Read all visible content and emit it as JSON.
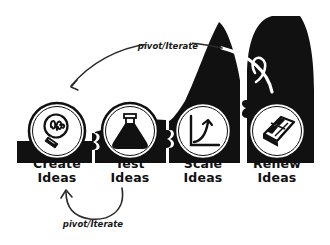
{
  "diagram": {
    "style": "hand-drawn sketch",
    "background_color": "#ffffff",
    "ink_color": "#111111",
    "ramp_color": "#111111",
    "node_fill_color": "#ffffff"
  },
  "stages": [
    {
      "id": "create",
      "line1": "Create",
      "line2": "Ideas",
      "icon": "lightbulb-icon",
      "cx": 57,
      "cy": 131,
      "r": 28,
      "label_x": 57,
      "label_y1": 168,
      "label_y2": 182
    },
    {
      "id": "test",
      "line1": "Test",
      "line2": "Ideas",
      "icon": "flask-icon",
      "cx": 130,
      "cy": 131,
      "r": 28,
      "label_x": 130,
      "label_y1": 168,
      "label_y2": 182
    },
    {
      "id": "scale",
      "line1": "Scale",
      "line2": "Ideas",
      "icon": "growth-chart-icon",
      "cx": 203,
      "cy": 131,
      "r": 28,
      "label_x": 203,
      "label_y1": 168,
      "label_y2": 182
    },
    {
      "id": "renew",
      "line1": "Renew",
      "line2": "Ideas",
      "icon": "solar-panel-icon",
      "cx": 277,
      "cy": 131,
      "r": 28,
      "label_x": 277,
      "label_y1": 168,
      "label_y2": 182
    }
  ],
  "arrows": [
    {
      "id": "top-feedback",
      "label": "pivot/Iterate",
      "from_stage": "renew",
      "to_stage": "create",
      "label_x": 168,
      "label_y": 49,
      "direction": "right-to-left"
    },
    {
      "id": "bottom-feedback",
      "label": "pivot/Iterate",
      "from_stage": "test",
      "to_stage": "create",
      "label_x": 93,
      "label_y": 227,
      "direction": "right-to-left"
    }
  ]
}
